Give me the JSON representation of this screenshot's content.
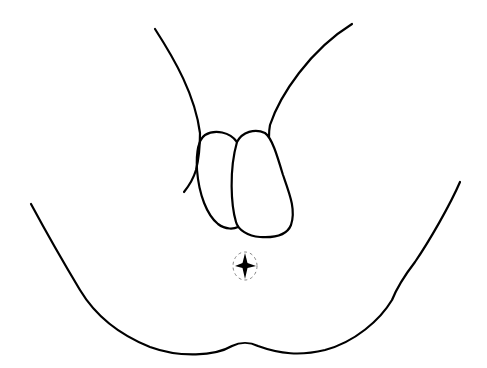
{
  "figure": {
    "type": "line-drawing",
    "background_color": "#ffffff",
    "stroke_color": "#000000",
    "marker": {
      "shape": "four-point-star",
      "center": [
        245,
        265
      ],
      "encircled_by": "dashed-ellipse"
    }
  }
}
